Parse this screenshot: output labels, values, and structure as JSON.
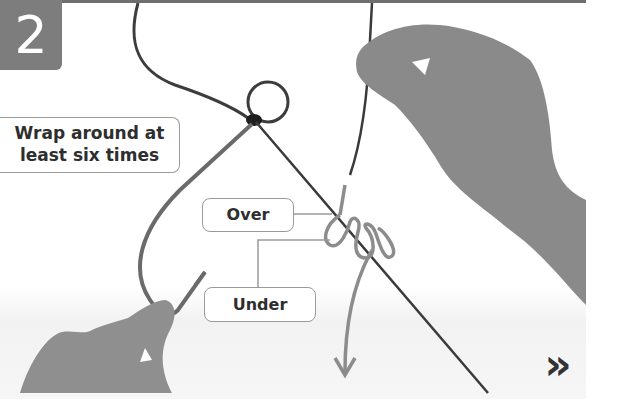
{
  "step": {
    "number": "2"
  },
  "callouts": {
    "wrap_line1": "Wrap around at",
    "wrap_line2": "least six times",
    "over": "Over",
    "under": "Under"
  },
  "navigation": {
    "next_icon": "double-chevron-right-icon",
    "next_glyph": "»"
  },
  "colors": {
    "badge": "#7d7d7d",
    "line_dark": "#3a3a3a",
    "line_light": "#8c8c8c",
    "skin": "#8a8a8a",
    "callout_border": "#9a9a9a",
    "text": "#2e2e2e"
  }
}
